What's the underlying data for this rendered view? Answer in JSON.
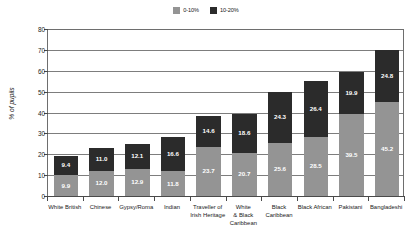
{
  "chart_data": {
    "type": "bar",
    "stacked": true,
    "title": "",
    "subtitle": "",
    "xlabel": "",
    "ylabel": "% of pupils",
    "ylim": [
      0,
      80
    ],
    "ytick_step": 10,
    "yticks": [
      "0",
      "10",
      "20",
      "30",
      "40",
      "50",
      "60",
      "70",
      "80"
    ],
    "grid": true,
    "legend_position": "top-center",
    "categories": [
      "White British",
      "Chinese",
      "Gypsy/Roma",
      "Indian",
      "Traveller of\nIrish Heritage",
      "White\n& Black\nCaribbean",
      "Black\nCaribbean",
      "Black African",
      "Pakistani",
      "Bangladeshi"
    ],
    "series": [
      {
        "name": "0-10%",
        "color": "#949494",
        "values": [
          9.9,
          12.0,
          12.9,
          11.8,
          23.7,
          20.7,
          25.6,
          28.5,
          39.5,
          45.2
        ]
      },
      {
        "name": "10-20%",
        "color": "#2b2b2b",
        "values": [
          9.4,
          11.0,
          12.1,
          16.6,
          14.6,
          18.6,
          24.3,
          26.4,
          19.9,
          24.8
        ]
      }
    ],
    "totals": [
      19.3,
      23.0,
      25.0,
      28.4,
      38.3,
      39.3,
      49.9,
      54.9,
      59.4,
      70.0
    ]
  },
  "legend": {
    "items": [
      {
        "label": "0-10%",
        "color": "#949494"
      },
      {
        "label": "10-20%",
        "color": "#2b2b2b"
      }
    ]
  },
  "axes": {
    "y_axis_title": "% of pupils"
  }
}
